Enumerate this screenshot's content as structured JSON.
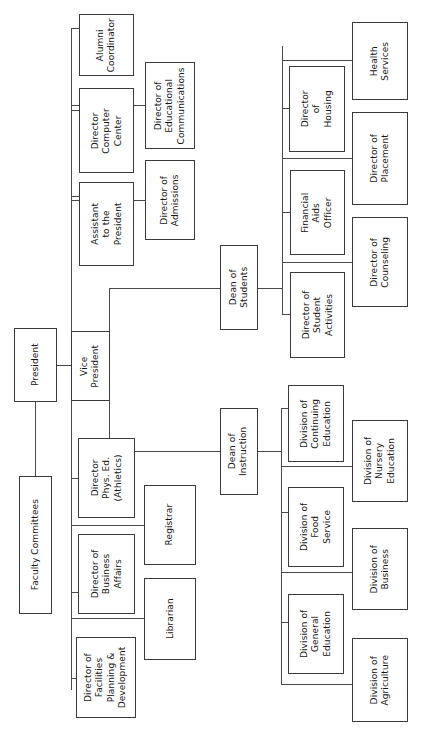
{
  "chart": {
    "type": "organizational-chart",
    "orientation": "rotated-90-counterclockwise",
    "canvas": {
      "width": 421,
      "height": 741
    },
    "line_color": "#4a4a4a",
    "box_border_color": "#3a3a3a",
    "background_color": "#ffffff",
    "text_color": "#161616"
  },
  "nodes": {
    "president": {
      "label": "President"
    },
    "faculty_committees": {
      "label": "Faculty Committees"
    },
    "vice_president": {
      "label": "Vice\nPresident"
    },
    "alumni_coordinator": {
      "label": "Alumni\nCoordinator"
    },
    "director_computer_center": {
      "label": "Director\nComputer\nCenter"
    },
    "assistant_to_president": {
      "label": "Assistant\nto the\nPresident"
    },
    "director_educational_communications": {
      "label": "Director of\nEducational\nCommunications"
    },
    "director_admissions": {
      "label": "Director of\nAdmissions"
    },
    "director_phys_ed": {
      "label": "Director\nPhys. Ed.\n(Athletics)"
    },
    "director_business_affairs": {
      "label": "Director of\nBusiness\nAffairs"
    },
    "director_facilities": {
      "label": "Director of\nFacilities\nPlanning &\nDevelopment"
    },
    "registrar": {
      "label": "Registrar"
    },
    "librarian": {
      "label": "Librarian"
    },
    "dean_of_students": {
      "label": "Dean of\nStudents"
    },
    "director_of_housing": {
      "label": "Director\nof\nHousing"
    },
    "financial_aids_officer": {
      "label": "Financial\nAids\nOfficer"
    },
    "director_student_activities": {
      "label": "Director of\nStudent\nActivities"
    },
    "health_services": {
      "label": "Health\nServices"
    },
    "director_of_placement": {
      "label": "Director of\nPlacement"
    },
    "director_of_counseling": {
      "label": "Director of\nCounseling"
    },
    "dean_of_instruction": {
      "label": "Dean of\nInstruction"
    },
    "division_continuing_education": {
      "label": "Division of\nContinuing\nEducation"
    },
    "division_food_service": {
      "label": "Division of\nFood\nService"
    },
    "division_general_education": {
      "label": "Division of\nGeneral\nEducation"
    },
    "division_nursery_education": {
      "label": "Division of\nNursery\nEducation"
    },
    "division_business": {
      "label": "Division of\nBusiness"
    },
    "division_agriculture": {
      "label": "Division of\nAgriculture"
    }
  },
  "hierarchy": {
    "root": "president",
    "edges": [
      {
        "from": "president",
        "to": "faculty_committees"
      },
      {
        "from": "president",
        "to": "vice_president"
      },
      {
        "from": "vice_president",
        "to": "alumni_coordinator"
      },
      {
        "from": "vice_president",
        "to": "director_computer_center"
      },
      {
        "from": "vice_president",
        "to": "assistant_to_president"
      },
      {
        "from": "vice_president",
        "to": "director_educational_communications"
      },
      {
        "from": "vice_president",
        "to": "director_admissions"
      },
      {
        "from": "vice_president",
        "to": "director_phys_ed"
      },
      {
        "from": "vice_president",
        "to": "director_business_affairs"
      },
      {
        "from": "vice_president",
        "to": "director_facilities"
      },
      {
        "from": "vice_president",
        "to": "registrar"
      },
      {
        "from": "vice_president",
        "to": "librarian"
      },
      {
        "from": "vice_president",
        "to": "dean_of_students"
      },
      {
        "from": "vice_president",
        "to": "dean_of_instruction"
      },
      {
        "from": "dean_of_students",
        "to": "director_of_housing"
      },
      {
        "from": "dean_of_students",
        "to": "financial_aids_officer"
      },
      {
        "from": "dean_of_students",
        "to": "director_student_activities"
      },
      {
        "from": "dean_of_students",
        "to": "health_services"
      },
      {
        "from": "dean_of_students",
        "to": "director_of_placement"
      },
      {
        "from": "dean_of_students",
        "to": "director_of_counseling"
      },
      {
        "from": "dean_of_instruction",
        "to": "division_continuing_education"
      },
      {
        "from": "dean_of_instruction",
        "to": "division_food_service"
      },
      {
        "from": "dean_of_instruction",
        "to": "division_general_education"
      },
      {
        "from": "dean_of_instruction",
        "to": "division_nursery_education"
      },
      {
        "from": "dean_of_instruction",
        "to": "division_business"
      },
      {
        "from": "dean_of_instruction",
        "to": "division_agriculture"
      }
    ]
  }
}
